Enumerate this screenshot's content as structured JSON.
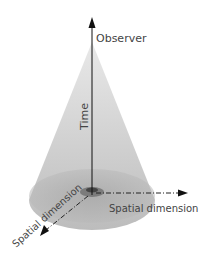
{
  "diagram": {
    "type": "light-cone",
    "labels": {
      "time_axis": "Time",
      "apex": "Observer",
      "spatial_x": "Spatial dimension",
      "spatial_y": "Spatial dimension"
    },
    "colors": {
      "cone_fill": "#b8b8b8",
      "base_fill": "#a9a9a9",
      "axis": "#111111",
      "text": "#444444"
    }
  }
}
